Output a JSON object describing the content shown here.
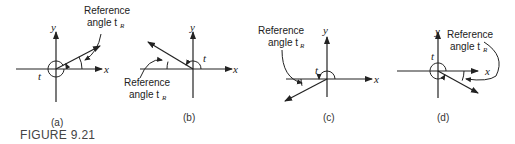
{
  "figure": {
    "caption": "FIGURE 9.21",
    "axis_labels": {
      "x": "x",
      "y": "y"
    },
    "angle_label": "t",
    "reference_label_line1": "Reference",
    "reference_label_line2": "angle t",
    "reference_subscript": "R",
    "panels": [
      {
        "id": "a",
        "label": "(a)",
        "quadrant": "I"
      },
      {
        "id": "b",
        "label": "(b)",
        "quadrant": "II"
      },
      {
        "id": "c",
        "label": "(c)",
        "quadrant": "III"
      },
      {
        "id": "d",
        "label": "(d)",
        "quadrant": "IV"
      }
    ]
  }
}
